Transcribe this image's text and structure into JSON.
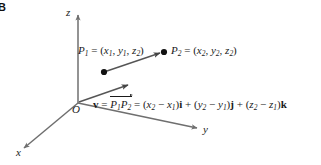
{
  "figure": {
    "tag": "B",
    "background_color": "#ffffff",
    "ink_color": "#1a1a1a",
    "axis_color": "#6f6f6f"
  },
  "axes": [
    {
      "name": "z-axis",
      "label": "z",
      "direction": "up"
    },
    {
      "name": "y-axis",
      "label": "y",
      "direction": "right-down"
    },
    {
      "name": "x-axis",
      "label": "x",
      "direction": "left-down"
    }
  ],
  "origin": {
    "label": "O"
  },
  "points": [
    {
      "name": "P1",
      "label_prefix": "P",
      "label_sub": "1",
      "equals": " = (",
      "coords": [
        {
          "var": "x",
          "sub": "1"
        },
        {
          "var": "y",
          "sub": "1"
        },
        {
          "var": "z",
          "sub": "2"
        }
      ],
      "coord_text": "= (x1, y1, z1)"
    },
    {
      "name": "P2",
      "label_prefix": "P",
      "label_sub": "2",
      "equals": " = (",
      "coords": [
        {
          "var": "x",
          "sub": "2"
        },
        {
          "var": "y",
          "sub": "2"
        },
        {
          "var": "z",
          "sub": "2"
        }
      ],
      "coord_text": "= (x2, y2, z2)"
    }
  ],
  "equation": {
    "vector_symbol": "v",
    "eq1": "=",
    "pp_p": "P",
    "pp_sub1": "1",
    "pp_p2": "P",
    "pp_sub2": "2",
    "eq2": "=",
    "term1_open": "(",
    "term1_a": "x",
    "term1_a_sub": "2",
    "term1_minus": "−",
    "term1_b": "x",
    "term1_b_sub": "1",
    "term1_close": ")",
    "unit1": "i",
    "plus1": "+",
    "term2_open": "(",
    "term2_a": "y",
    "term2_a_sub": "2",
    "term2_minus": "−",
    "term2_b": "y",
    "term2_b_sub": "1",
    "term2_close": ")",
    "unit2": "j",
    "plus2": "+",
    "term3_open": "(",
    "term3_a": "z",
    "term3_a_sub": "2",
    "term3_minus": "−",
    "term3_b": "z",
    "term3_b_sub": "1",
    "term3_close": ")",
    "unit3": "k",
    "full_text": "v = P1P2 = (x2 − x1)i + (y2 − y1)j + (z2 − z1)k"
  },
  "vectors": [
    {
      "name": "p1-to-p2-arrow",
      "from": "P1",
      "to": "P2"
    },
    {
      "name": "free-vector-arrow",
      "from": "origin",
      "to": "v-tip"
    }
  ]
}
